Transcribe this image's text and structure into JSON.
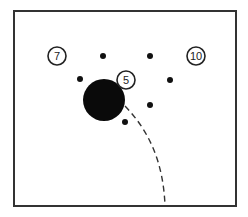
{
  "diagram": {
    "frame": {
      "x": 14,
      "y": 11,
      "width": 222,
      "height": 195,
      "stroke": "#333333",
      "stroke_width": 2
    },
    "numbered_markers": [
      {
        "label": "7",
        "cx": 57,
        "cy": 56,
        "r": 9
      },
      {
        "label": "10",
        "cx": 196,
        "cy": 56,
        "r": 9
      },
      {
        "label": "5",
        "cx": 126,
        "cy": 80,
        "r": 9
      }
    ],
    "large_disc": {
      "cx": 104,
      "cy": 100,
      "r": 21,
      "fill": "#0a0a0a"
    },
    "dots": [
      {
        "cx": 103,
        "cy": 56
      },
      {
        "cx": 150,
        "cy": 56
      },
      {
        "cx": 80,
        "cy": 79
      },
      {
        "cx": 170,
        "cy": 80
      },
      {
        "cx": 150,
        "cy": 105
      },
      {
        "cx": 125,
        "cy": 122
      }
    ],
    "dot_radius": 3,
    "path": {
      "style": "dashed",
      "d": "M 125 106 C 148 130, 163 160, 165 205",
      "dasharray": "6 4"
    }
  }
}
